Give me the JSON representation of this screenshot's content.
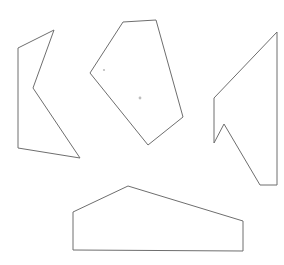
{
  "figure": {
    "background_color": "#ffffff",
    "stroke_color": "#6e6e6e",
    "stroke_width": 1,
    "width": 284,
    "height": 265
  },
  "chart_data": {
    "type": "diagram",
    "xlabel": "",
    "ylabel": "",
    "grid": false,
    "legend": "none",
    "xlim": [
      0,
      284
    ],
    "ylim": [
      0,
      265
    ],
    "shapes": [
      {
        "name": "concave-arrow-left",
        "vertex_count": 5,
        "convex": false,
        "points": "54,30 18,48 18,148 80,158 33,88",
        "fill": "none",
        "stroke": "#6e6e6e"
      },
      {
        "name": "convex-pentagon-center",
        "vertex_count": 5,
        "convex": true,
        "points": "123,22 156,20 183,117 148,145 90,73",
        "fill": "none",
        "stroke": "#6e6e6e"
      },
      {
        "name": "concave-flag-right",
        "vertex_count": 6,
        "convex": false,
        "points": "277,32 277,185 260,185 224,124 214,143 214,98",
        "fill": "none",
        "stroke": "#6e6e6e"
      },
      {
        "name": "house-pentagon-bottom",
        "vertex_count": 5,
        "convex": true,
        "points": "128,186 243,221 243,251 73,250 73,212",
        "fill": "none",
        "stroke": "#6e6e6e"
      }
    ],
    "specks": [
      {
        "name": "speck-upper",
        "x": 104,
        "y": 70,
        "r": 1.1
      },
      {
        "name": "speck-lower",
        "x": 140,
        "y": 98,
        "r": 1.4
      }
    ]
  }
}
